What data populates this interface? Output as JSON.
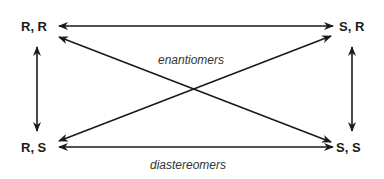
{
  "diagram": {
    "nodes": {
      "rr": "R, R",
      "sr": "S, R",
      "rs": "R, S",
      "ss": "S, S"
    },
    "labels": {
      "enantiomers": "enantiomers",
      "diastereomers": "diastereomers"
    },
    "edges": [
      {
        "from": "R, R",
        "to": "S, R",
        "style": "double-arrow"
      },
      {
        "from": "R, S",
        "to": "S, S",
        "style": "double-arrow"
      },
      {
        "from": "R, R",
        "to": "R, S",
        "style": "double-arrow"
      },
      {
        "from": "S, R",
        "to": "S, S",
        "style": "double-arrow"
      },
      {
        "from": "R, R",
        "to": "S, S",
        "style": "double-arrow"
      },
      {
        "from": "R, S",
        "to": "S, R",
        "style": "double-arrow"
      }
    ],
    "colors": {
      "line": "#1a1a1a",
      "text": "#1a1a1a",
      "caption": "#333333"
    }
  }
}
